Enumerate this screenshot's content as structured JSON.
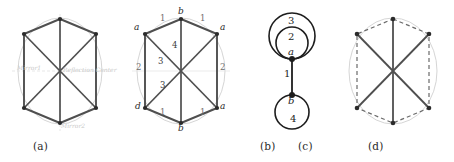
{
  "figure": {
    "panels": [
      {
        "id": "a",
        "caption": "(a)",
        "description": "hexagon-with-diagonals graph inscribed in a circle, mirror axes shown",
        "axis_labels": {
          "horizontal_mirror": "Mirror1",
          "vertical_mirror": "Mirror2",
          "center": "Reflection Center"
        }
      },
      {
        "id": "b",
        "caption": "(b)",
        "description": "same hexagonal graph with labelled vertices and edge orbit numbers",
        "vertex_labels": {
          "top": "b",
          "top_left": "a",
          "top_right": "a",
          "bottom_left": "d",
          "bottom": "b",
          "bottom_right": "a"
        },
        "edge_labels": {
          "top_left_edge": "1",
          "top_right_edge": "1",
          "bottom_left_edge": "1",
          "bottom_right_edge": "1",
          "left_side": "2",
          "right_side": "2",
          "upper_vertical": "4",
          "upper_left_diagonal": "3",
          "lower_left_diagonal": "3"
        }
      },
      {
        "id": "c",
        "caption": "(c)",
        "description": "quotient multigraph with two loops at a, one bridge, one loop at b",
        "nodes": [
          {
            "name": "a",
            "label": "a"
          },
          {
            "name": "b",
            "label": "b"
          }
        ],
        "loops": [
          {
            "at": "a",
            "label": "3",
            "size": "outer"
          },
          {
            "at": "a",
            "label": "2",
            "size": "inner"
          },
          {
            "at": "b",
            "label": "4",
            "size": "single"
          }
        ],
        "edges": [
          {
            "from": "a",
            "to": "b",
            "label": "1"
          }
        ]
      },
      {
        "id": "d",
        "caption": "(d)",
        "description": "hexagonal graph with dashed perimeter edges and solid interior edges"
      }
    ]
  },
  "colors": {
    "edge_dark": "#4a4a4a",
    "edge_medium": "#5d5d5d",
    "circle_light": "#c8c8c8",
    "axis_light": "#d8d8d8",
    "vertex": "#2b2b2b",
    "text": "#2a2a2a",
    "faint_text": "#c9c9c9"
  }
}
